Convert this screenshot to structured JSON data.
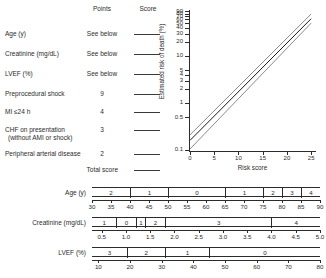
{
  "headers": {
    "points": "Points",
    "score": "Score"
  },
  "variables": [
    {
      "label": "Age (y)",
      "sub": "",
      "points": "See below"
    },
    {
      "label": "Creatinine (mg/dL)",
      "sub": "",
      "points": "See below"
    },
    {
      "label": "LVEF (%)",
      "sub": "",
      "points": "See below"
    },
    {
      "label": "Preprocedural shock",
      "sub": "",
      "points": "9"
    },
    {
      "label": "MI ≤24 h",
      "sub": "",
      "points": "4"
    },
    {
      "label": "CHF on presentation",
      "sub": "(without AMI or shock)",
      "points": "3"
    },
    {
      "label": "Peripheral arterial disease",
      "sub": "",
      "points": "2"
    },
    {
      "label": "Total score",
      "sub": "",
      "points": ""
    }
  ],
  "chart_data": {
    "type": "line",
    "title": "",
    "xlabel": "Risk score",
    "ylabel": "Estimated risk of death (%)",
    "xlim": [
      0,
      26
    ],
    "xticks": [
      0,
      5,
      10,
      15,
      20,
      25
    ],
    "xtick_labels": [
      "0",
      "5",
      "10",
      "15",
      "20",
      "25"
    ],
    "yscale": "log",
    "ylim": [
      0.1,
      95
    ],
    "yticks": [
      0.1,
      0.5,
      1,
      2,
      3,
      4,
      5,
      10,
      20,
      30,
      40,
      50,
      60,
      70,
      80,
      90
    ],
    "ytick_labels": [
      "0.1",
      "0.5",
      "1",
      "2",
      "3",
      "4",
      "5",
      "10",
      "20",
      "30",
      "40",
      "50",
      "60",
      "70",
      "80",
      "90"
    ],
    "grid": false,
    "legend": "none",
    "series": [
      {
        "name": "estimated risk",
        "color": "#1a1a1a",
        "x": [
          0,
          25
        ],
        "y": [
          0.16,
          62
        ]
      },
      {
        "name": "upper confidence limit",
        "color": "#8a8a8a",
        "x": [
          0,
          25
        ],
        "y": [
          0.21,
          78
        ]
      },
      {
        "name": "lower confidence limit",
        "color": "#8a8a8a",
        "x": [
          0,
          25
        ],
        "y": [
          0.105,
          50
        ]
      }
    ]
  },
  "scales": [
    {
      "label": "Age (y)",
      "segments": [
        {
          "points": "2",
          "from": 30,
          "to": 40
        },
        {
          "points": "1",
          "from": 40,
          "to": 50
        },
        {
          "points": "0",
          "from": 50,
          "to": 65
        },
        {
          "points": "1",
          "from": 65,
          "to": 75
        },
        {
          "points": "2",
          "from": 75,
          "to": 80
        },
        {
          "points": "3",
          "from": 80,
          "to": 85
        },
        {
          "points": "4",
          "from": 85,
          "to": 90
        }
      ],
      "axis_min": 30,
      "axis_max": 90,
      "ticks": [
        30,
        35,
        40,
        45,
        50,
        55,
        60,
        65,
        70,
        75,
        80,
        85,
        90
      ],
      "tick_labels": [
        "30",
        "35",
        "40",
        "45",
        "50",
        "55",
        "60",
        "65",
        "70",
        "75",
        "80",
        "85",
        "90"
      ]
    },
    {
      "label": "Creatinine (mg/dL)",
      "segments": [
        {
          "points": "1",
          "from": 0.3,
          "to": 0.8
        },
        {
          "points": "0",
          "from": 0.8,
          "to": 1.2
        },
        {
          "points": "1",
          "from": 1.2,
          "to": 1.4
        },
        {
          "points": "2",
          "from": 1.4,
          "to": 1.8
        },
        {
          "points": "3",
          "from": 1.8,
          "to": 4.0
        },
        {
          "points": "4",
          "from": 4.0,
          "to": 5.0
        }
      ],
      "axis_min": 0.3,
      "axis_max": 5.0,
      "ticks": [
        0.5,
        1.0,
        1.5,
        2.0,
        2.5,
        3.0,
        3.5,
        4.0,
        4.5,
        5.0
      ],
      "tick_labels": [
        "0.5",
        "1.0",
        "1.5",
        "2.0",
        "2.5",
        "3.0",
        "3.5",
        "4.0",
        "4.5",
        "5.0"
      ]
    },
    {
      "label": "LVEF (%)",
      "segments": [
        {
          "points": "3",
          "from": 8,
          "to": 19
        },
        {
          "points": "2",
          "from": 19,
          "to": 31
        },
        {
          "points": "1",
          "from": 31,
          "to": 45
        },
        {
          "points": "0",
          "from": 45,
          "to": 80
        }
      ],
      "axis_min": 8,
      "axis_max": 80,
      "ticks": [
        10,
        20,
        30,
        40,
        50,
        60,
        70,
        80
      ],
      "tick_labels": [
        "10",
        "20",
        "30",
        "40",
        "50",
        "60",
        "70",
        "80"
      ]
    }
  ]
}
